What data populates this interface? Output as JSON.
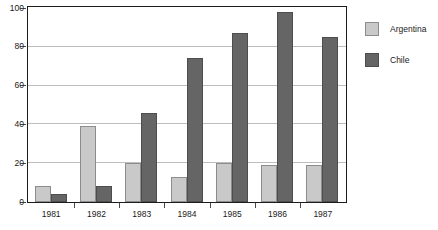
{
  "chart_data": {
    "type": "bar",
    "title": "",
    "subtitle": "",
    "xlabel": "",
    "ylabel": "",
    "categories": [
      "1981",
      "1982",
      "1983",
      "1984",
      "1985",
      "1986",
      "1987"
    ],
    "series": [
      {
        "name": "Argentina",
        "color": "#c9c9c9",
        "values": [
          8,
          39,
          20,
          13,
          20,
          19,
          19
        ]
      },
      {
        "name": "Chile",
        "color": "#656565",
        "values": [
          4,
          8,
          46,
          74,
          87,
          98,
          85
        ]
      }
    ],
    "ylim": [
      0,
      100
    ],
    "yticks": [
      0,
      20,
      40,
      60,
      80,
      100
    ],
    "ytick_labels": [
      "0",
      "20",
      "40",
      "60",
      "80",
      "100"
    ],
    "grid": true,
    "grid_axis": "y",
    "legend": {
      "position": "right",
      "entries": [
        {
          "label": "Argentina",
          "color": "#c9c9c9"
        },
        {
          "label": "Chile",
          "color": "#656565"
        }
      ]
    },
    "frame": true,
    "annotations": []
  },
  "colors": {
    "series_argentina": "#c9c9c9",
    "series_chile": "#656565",
    "gridline": "#bdbdbd",
    "axis": "#1c1c1c",
    "text": "#1a1a1a",
    "background": "#ffffff"
  }
}
